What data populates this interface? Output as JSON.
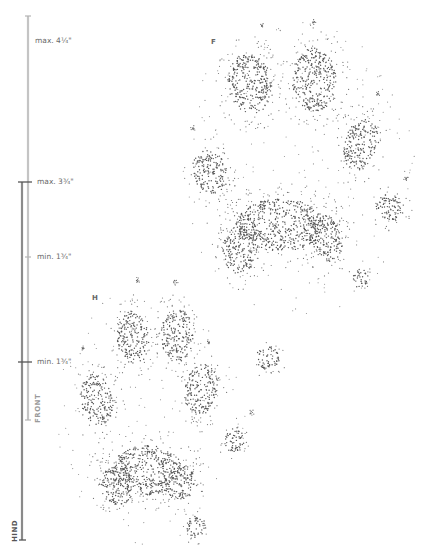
{
  "scale": {
    "front_bar_label": "FRONT",
    "hind_bar_label": "HIND",
    "marks": [
      {
        "label": "max. 4¼\"",
        "y": 41
      },
      {
        "label": "max. 3¾\"",
        "y": 182
      },
      {
        "label": "min. 1¾\"",
        "y": 257
      },
      {
        "label": "min. 1¾\"",
        "y": 362
      }
    ],
    "colors": {
      "front": "#bdbdbd",
      "hind": "#7d7d7d"
    }
  },
  "paws": {
    "front": {
      "letter": "F",
      "pads": [
        {
          "cx": 250,
          "cy": 84,
          "rx": 22,
          "ry": 30,
          "rot": -10
        },
        {
          "cx": 314,
          "cy": 80,
          "rx": 22,
          "ry": 32,
          "rot": 0
        },
        {
          "cx": 361,
          "cy": 145,
          "rx": 17,
          "ry": 26,
          "rot": 15
        },
        {
          "cx": 210,
          "cy": 172,
          "rx": 17,
          "ry": 22,
          "rot": -20
        },
        {
          "cx": 280,
          "cy": 225,
          "rx": 45,
          "ry": 26,
          "rot": 0
        },
        {
          "cx": 240,
          "cy": 250,
          "rx": 17,
          "ry": 24,
          "rot": 0
        },
        {
          "cx": 326,
          "cy": 238,
          "rx": 16,
          "ry": 24,
          "rot": -15
        },
        {
          "cx": 390,
          "cy": 208,
          "rx": 14,
          "ry": 14,
          "rot": 0
        },
        {
          "cx": 360,
          "cy": 278,
          "rx": 8,
          "ry": 10,
          "rot": 0
        },
        {
          "cx": 268,
          "cy": 358,
          "rx": 12,
          "ry": 12,
          "rot": 0
        }
      ],
      "claws": [
        [
          262,
          26
        ],
        [
          314,
          22
        ],
        [
          378,
          94
        ],
        [
          193,
          128
        ],
        [
          406,
          179
        ]
      ],
      "outline": {
        "cx": 295,
        "cy": 170,
        "rx": 120,
        "ry": 150
      }
    },
    "hind": {
      "letter": "H",
      "pads": [
        {
          "cx": 133,
          "cy": 338,
          "rx": 16,
          "ry": 27,
          "rot": -5
        },
        {
          "cx": 177,
          "cy": 335,
          "rx": 16,
          "ry": 27,
          "rot": 0
        },
        {
          "cx": 201,
          "cy": 390,
          "rx": 16,
          "ry": 26,
          "rot": 10
        },
        {
          "cx": 97,
          "cy": 400,
          "rx": 16,
          "ry": 26,
          "rot": -10
        },
        {
          "cx": 147,
          "cy": 470,
          "rx": 35,
          "ry": 25,
          "rot": 0
        },
        {
          "cx": 118,
          "cy": 485,
          "rx": 17,
          "ry": 20,
          "rot": 0
        },
        {
          "cx": 180,
          "cy": 482,
          "rx": 15,
          "ry": 18,
          "rot": 0
        },
        {
          "cx": 234,
          "cy": 440,
          "rx": 10,
          "ry": 13,
          "rot": 0
        },
        {
          "cx": 196,
          "cy": 527,
          "rx": 10,
          "ry": 11,
          "rot": 0
        }
      ],
      "claws": [
        [
          138,
          280
        ],
        [
          176,
          282
        ],
        [
          209,
          342
        ],
        [
          83,
          349
        ],
        [
          252,
          412
        ]
      ],
      "outline": {
        "cx": 150,
        "cy": 415,
        "rx": 95,
        "ry": 130
      }
    }
  }
}
